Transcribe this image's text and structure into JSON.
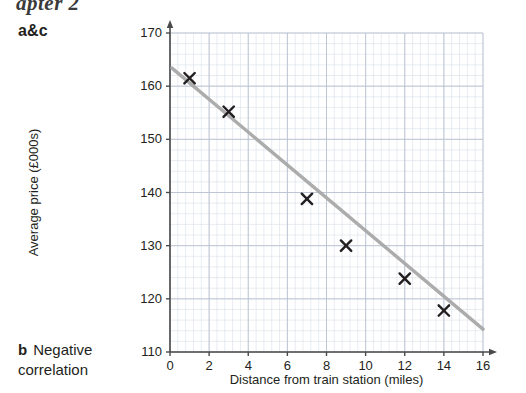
{
  "page": {
    "crop_heading": "apter 2",
    "answers": [
      {
        "label": "a&c",
        "text": ""
      },
      {
        "label": "b",
        "text": "Negative correlation"
      }
    ]
  },
  "chart_data": {
    "type": "scatter",
    "title": "",
    "xlabel": "Distance from train station (miles)",
    "ylabel": "Average price (£000s)",
    "xlim": [
      0,
      16
    ],
    "ylim": [
      110,
      170
    ],
    "xticks": [
      0,
      2,
      4,
      6,
      8,
      10,
      12,
      14,
      16
    ],
    "yticks": [
      110,
      120,
      130,
      140,
      150,
      160,
      170
    ],
    "grid": true,
    "grid_minor_step_x": 0.4,
    "grid_minor_step_y": 2,
    "legend": null,
    "marker": "x-cross",
    "marker_color": "#231f20",
    "points": [
      {
        "x": 1,
        "y": 161.5
      },
      {
        "x": 3,
        "y": 155.2
      },
      {
        "x": 7,
        "y": 138.8
      },
      {
        "x": 9,
        "y": 130.0
      },
      {
        "x": 12,
        "y": 123.8
      },
      {
        "x": 14,
        "y": 117.8
      }
    ],
    "series": [
      {
        "name": "Line of best fit",
        "type": "line",
        "color": "#a8a8a8",
        "x": [
          0.1,
          16.0
        ],
        "y": [
          163.4,
          114.3
        ]
      }
    ]
  },
  "colors": {
    "grid_minor": "#d9dfe8",
    "grid_major": "#b9c2d0",
    "axis": "#4a4a4a",
    "text": "#231f20",
    "trend_line": "#a8a8a8"
  }
}
